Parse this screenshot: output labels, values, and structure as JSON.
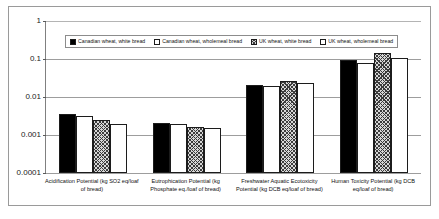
{
  "chart_data": {
    "type": "bar",
    "title": "",
    "xlabel": "",
    "ylabel": "",
    "yscale": "log",
    "ylim": [
      0.0001,
      1
    ],
    "grid": true,
    "legend_position": "top-center",
    "ytick_labels": [
      "1",
      "0.1",
      "0.01",
      "0.001",
      "0.0001"
    ],
    "ytick_values": [
      1,
      0.1,
      0.01,
      0.001,
      0.0001
    ],
    "categories": [
      "Acidification Potential (kg SO2 eq/loaf of bread)",
      "Eutrophication Potential (kg Phosphate eq./loaf of bread)",
      "Freshwater Aquatic Ecotoxicity Potential (kg DCB eq/loaf of bread)",
      "Human Toxicity Potential (kg DCB eq/loaf of bread)"
    ],
    "series": [
      {
        "name": "Canadian wheat, white bread",
        "pattern": "solid-black",
        "values": [
          0.0035,
          0.0021,
          0.021,
          0.095
        ]
      },
      {
        "name": "Canadian wheat, wholemeal bread",
        "pattern": "dotted",
        "values": [
          0.0031,
          0.0019,
          0.019,
          0.079
        ]
      },
      {
        "name": "UK wheat, white bread",
        "pattern": "cross-hatch",
        "values": [
          0.0025,
          0.0016,
          0.027,
          0.14
        ]
      },
      {
        "name": "UK wheat, wholemeal bread",
        "pattern": "open-white",
        "values": [
          0.002,
          0.0015,
          0.024,
          0.105
        ]
      }
    ]
  }
}
